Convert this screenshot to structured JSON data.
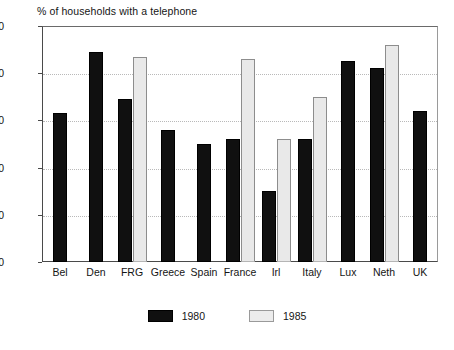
{
  "chart_data": {
    "type": "bar",
    "title": "% of households with a telephone",
    "xlabel": "",
    "ylabel": "",
    "ylim": [
      0,
      100
    ],
    "yticks": [
      0,
      20,
      40,
      60,
      80,
      100
    ],
    "grid": true,
    "legend_position": "bottom-center",
    "categories": [
      "Bel",
      "Den",
      "FRG",
      "Greece",
      "Spain",
      "France",
      "Irl",
      "Italy",
      "Lux",
      "Neth",
      "UK"
    ],
    "series": [
      {
        "name": "1980",
        "color": "#101010",
        "values": [
          63,
          89,
          69,
          56,
          50,
          52,
          30,
          52,
          85,
          82,
          64
        ]
      },
      {
        "name": "1985",
        "color": "#e9e9e9",
        "values": [
          null,
          null,
          87,
          null,
          null,
          86,
          52,
          70,
          null,
          92,
          null
        ]
      }
    ]
  },
  "legend": {
    "entries": [
      {
        "label": "1980",
        "swatch": "black-swatch-icon"
      },
      {
        "label": "1985",
        "swatch": "gray-swatch-icon"
      }
    ]
  },
  "axis": {
    "y_tick_labels": [
      "100",
      "80",
      "60",
      "40",
      "20",
      "0"
    ]
  }
}
